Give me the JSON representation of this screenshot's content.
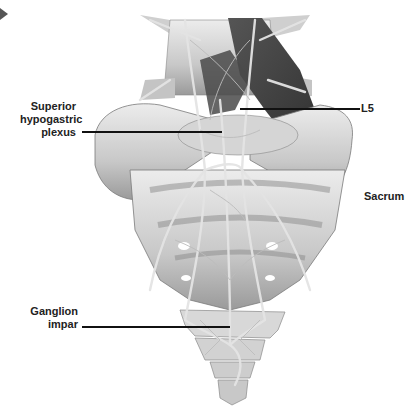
{
  "figure": {
    "labels": {
      "superior_hypogastric_plexus": [
        "Superior",
        "hypogastric",
        "plexus"
      ],
      "l5": "L5",
      "sacrum": "Sacrum",
      "ganglion_impar": [
        "Ganglion",
        "impar"
      ]
    },
    "colors": {
      "bone_light": "#e6e6e6",
      "bone_mid": "#b8b8b8",
      "bone_dark": "#6e6e6e",
      "muscle_dark": "#3c3c3c",
      "nerve": "#d8d8d8",
      "text": "#222222",
      "leader_line": "#111111"
    }
  }
}
